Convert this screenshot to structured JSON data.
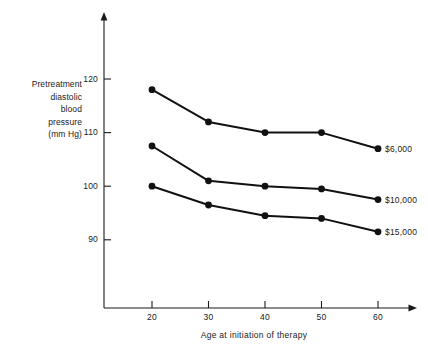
{
  "chart_data": {
    "type": "line",
    "title": "",
    "xlabel": "Age at initiation of therapy",
    "ylabel": "Pretreatment diastolic blood pressure (mm Hg)",
    "ylabel_lines": [
      "Pretreatment",
      "diastolic",
      "blood",
      "pressure",
      "(mm Hg)"
    ],
    "x": [
      20,
      30,
      40,
      50,
      60
    ],
    "x_tick_labels": [
      "20",
      "30",
      "40",
      "50",
      "60"
    ],
    "y_tick_values": [
      120,
      110,
      100,
      90
    ],
    "y_tick_labels": [
      "120",
      "110",
      "100",
      "90"
    ],
    "xlim": [
      12,
      65
    ],
    "ylim": [
      82,
      127
    ],
    "grid": false,
    "legend_position": "right-inline-end-of-line",
    "series": [
      {
        "name": "$6,000",
        "label": "$6,000",
        "values": [
          118.0,
          112.0,
          110.0,
          110.0,
          107.0
        ]
      },
      {
        "name": "$10,000",
        "label": "$10,000",
        "values": [
          107.5,
          101.0,
          100.0,
          99.5,
          97.5
        ]
      },
      {
        "name": "$15,000",
        "label": "$15,000",
        "values": [
          100.0,
          96.5,
          94.5,
          94.0,
          91.5
        ]
      }
    ],
    "colors": {
      "line": "#111111",
      "marker": "#111111",
      "axis": "#1a1a1a",
      "background": "#ffffff",
      "text": "#1a1a1a"
    }
  }
}
